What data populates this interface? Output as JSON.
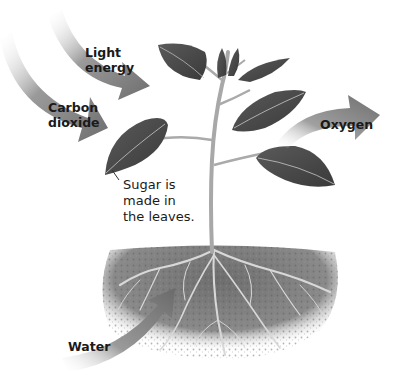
{
  "diagram": {
    "labels": {
      "light_energy": "Light\nenergy",
      "carbon_dioxide": "Carbon\ndioxide",
      "oxygen": "Oxygen",
      "water": "Water",
      "sugar": "Sugar is\nmade in\nthe leaves."
    },
    "colors": {
      "arrow": "#7a7a7a",
      "leaf": "#4a4a4a",
      "stem": "#b0b0b0",
      "soil": "#6b6b6b",
      "text": "#1a1a1a"
    }
  }
}
